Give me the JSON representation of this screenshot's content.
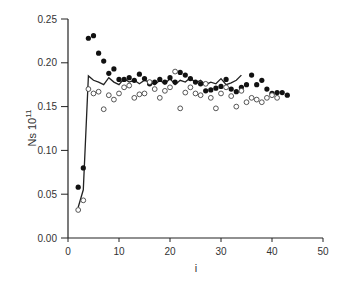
{
  "chart_data": {
    "type": "scatter",
    "title": "",
    "xlabel": "i",
    "ylabel": "Ns 10",
    "ylabel_superscript": "11",
    "xlim": [
      0,
      50
    ],
    "ylim": [
      0.0,
      0.25
    ],
    "xticks": [
      "0",
      "10",
      "20",
      "30",
      "40",
      "50"
    ],
    "yticks": [
      "0.00",
      "0.05",
      "0.10",
      "0.15",
      "0.20",
      "0.25"
    ],
    "grid": false,
    "legend": null,
    "series": [
      {
        "name": "filled-circles",
        "marker": "filled-circle",
        "points": [
          [
            2,
            0.058
          ],
          [
            3,
            0.08
          ],
          [
            4,
            0.228
          ],
          [
            5,
            0.231
          ],
          [
            6,
            0.211
          ],
          [
            7,
            0.202
          ],
          [
            8,
            0.188
          ],
          [
            9,
            0.193
          ],
          [
            10,
            0.181
          ],
          [
            11,
            0.181
          ],
          [
            12,
            0.183
          ],
          [
            13,
            0.18
          ],
          [
            14,
            0.187
          ],
          [
            15,
            0.182
          ],
          [
            16,
            0.176
          ],
          [
            17,
            0.178
          ],
          [
            18,
            0.181
          ],
          [
            19,
            0.178
          ],
          [
            20,
            0.183
          ],
          [
            21,
            0.178
          ],
          [
            22,
            0.189
          ],
          [
            23,
            0.186
          ],
          [
            24,
            0.182
          ],
          [
            25,
            0.178
          ],
          [
            26,
            0.176
          ],
          [
            27,
            0.168
          ],
          [
            28,
            0.169
          ],
          [
            29,
            0.171
          ],
          [
            30,
            0.173
          ],
          [
            31,
            0.181
          ],
          [
            32,
            0.17
          ],
          [
            33,
            0.167
          ],
          [
            34,
            0.172
          ],
          [
            35,
            0.175
          ],
          [
            36,
            0.186
          ],
          [
            37,
            0.175
          ],
          [
            38,
            0.18
          ],
          [
            39,
            0.17
          ],
          [
            40,
            0.165
          ],
          [
            41,
            0.166
          ],
          [
            42,
            0.166
          ],
          [
            43,
            0.163
          ]
        ]
      },
      {
        "name": "open-circles",
        "marker": "open-circle",
        "points": [
          [
            2,
            0.032
          ],
          [
            3,
            0.043
          ],
          [
            4,
            0.17
          ],
          [
            5,
            0.165
          ],
          [
            6,
            0.167
          ],
          [
            7,
            0.147
          ],
          [
            8,
            0.163
          ],
          [
            9,
            0.158
          ],
          [
            10,
            0.165
          ],
          [
            11,
            0.172
          ],
          [
            12,
            0.174
          ],
          [
            13,
            0.16
          ],
          [
            14,
            0.164
          ],
          [
            15,
            0.165
          ],
          [
            16,
            0.178
          ],
          [
            17,
            0.17
          ],
          [
            18,
            0.16
          ],
          [
            19,
            0.168
          ],
          [
            20,
            0.172
          ],
          [
            21,
            0.19
          ],
          [
            22,
            0.148
          ],
          [
            23,
            0.166
          ],
          [
            24,
            0.172
          ],
          [
            25,
            0.165
          ],
          [
            26,
            0.163
          ],
          [
            27,
            0.176
          ],
          [
            28,
            0.16
          ],
          [
            29,
            0.148
          ],
          [
            30,
            0.165
          ],
          [
            31,
            0.172
          ],
          [
            32,
            0.162
          ],
          [
            33,
            0.15
          ],
          [
            34,
            0.168
          ],
          [
            35,
            0.155
          ],
          [
            36,
            0.16
          ],
          [
            37,
            0.158
          ],
          [
            38,
            0.155
          ],
          [
            39,
            0.16
          ],
          [
            40,
            0.163
          ],
          [
            41,
            0.16
          ]
        ]
      },
      {
        "name": "line",
        "marker": "line",
        "points": [
          [
            2,
            0.035
          ],
          [
            3,
            0.055
          ],
          [
            4,
            0.185
          ],
          [
            5,
            0.18
          ],
          [
            6,
            0.178
          ],
          [
            7,
            0.175
          ],
          [
            8,
            0.183
          ],
          [
            9,
            0.178
          ],
          [
            10,
            0.175
          ],
          [
            11,
            0.182
          ],
          [
            12,
            0.178
          ],
          [
            13,
            0.18
          ],
          [
            14,
            0.176
          ],
          [
            15,
            0.18
          ],
          [
            16,
            0.178
          ],
          [
            17,
            0.175
          ],
          [
            18,
            0.18
          ],
          [
            19,
            0.176
          ],
          [
            20,
            0.182
          ],
          [
            21,
            0.175
          ],
          [
            22,
            0.18
          ],
          [
            23,
            0.178
          ],
          [
            24,
            0.183
          ],
          [
            25,
            0.177
          ],
          [
            26,
            0.18
          ],
          [
            27,
            0.175
          ],
          [
            28,
            0.178
          ],
          [
            29,
            0.176
          ],
          [
            30,
            0.182
          ],
          [
            31,
            0.175
          ],
          [
            32,
            0.177
          ],
          [
            33,
            0.18
          ],
          [
            34,
            0.186
          ]
        ]
      }
    ]
  }
}
